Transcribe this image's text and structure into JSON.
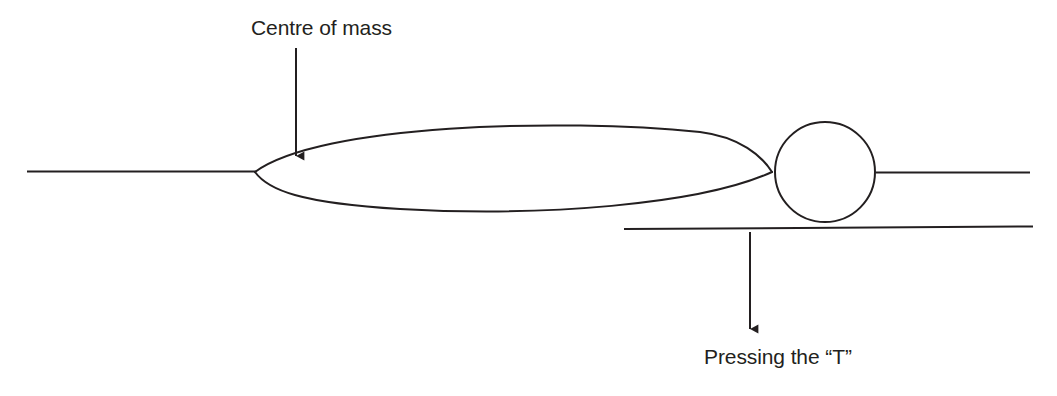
{
  "diagram": {
    "background_color": "#ffffff",
    "stroke_color": "#231f20",
    "text_color": "#231f20",
    "annotations": {
      "centre_of_mass": {
        "text": "Centre of mass",
        "arrow_direction": "down",
        "arrow_from": [
          296,
          48
        ],
        "arrow_to": [
          296,
          165
        ]
      },
      "pressing_the_t": {
        "text": "Pressing the “T”",
        "arrow_direction": "down",
        "arrow_from": [
          750,
          232
        ],
        "arrow_to": [
          750,
          338
        ]
      }
    },
    "shapes": {
      "lens_body": {
        "name": "lens-shaped-body",
        "left_tip": [
          255,
          172
        ],
        "right_tip": [
          772,
          172
        ],
        "top_y": 125,
        "bottom_y": 212
      },
      "circle_head": {
        "name": "circle",
        "center": [
          825,
          172
        ],
        "radius": 50
      },
      "left_line": {
        "name": "left-horizontal-line",
        "from": [
          27,
          171
        ],
        "to": [
          255,
          171
        ]
      },
      "right_line": {
        "name": "right-horizontal-line",
        "from": [
          880,
          173
        ],
        "to": [
          1030,
          173
        ]
      },
      "lower_line": {
        "name": "lower-horizontal-line",
        "from": [
          624,
          229
        ],
        "to": [
          1033,
          227
        ]
      }
    }
  }
}
